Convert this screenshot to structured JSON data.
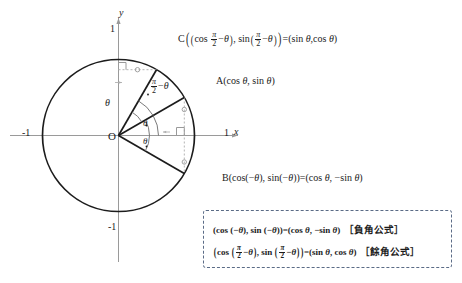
{
  "diagram": {
    "type": "unit-circle-trigonometry",
    "title_visible": false,
    "axes": {
      "x_axis_label": "x",
      "y_axis_label": "y",
      "origin_label": "O",
      "x_tick_neg_label": "-1",
      "x_tick_pos_label": "1",
      "y_tick_top_label": "1",
      "y_tick_bottom_label": "-1"
    },
    "points": {
      "A": {
        "name": "A",
        "label": "A(cos θ, sin θ)",
        "label_plain": "A(cos theta, sin theta)",
        "angle_deg": 30,
        "coords_unit": [
          0.866,
          0.5
        ]
      },
      "B": {
        "name": "B",
        "label": "B(cos(−θ), sin(−θ)) = (cos θ, −sin θ)",
        "label_plain": "B(cos(-theta), sin(-theta)) = (cos theta, -sin theta)",
        "angle_deg": -30,
        "coords_unit": [
          0.866,
          -0.5
        ]
      },
      "C": {
        "name": "C",
        "label": "C((cos(π/2 − θ), sin(π/2 − θ)) = (sin θ, cos θ)",
        "label_plain": "C((cos(pi/2 - theta), sin(pi/2 - theta)) = (sin theta, cos theta)",
        "angle_deg": 60,
        "coords_unit": [
          0.5,
          0.866
        ]
      }
    },
    "angles": {
      "theta_upper": "θ",
      "theta_first": "θ",
      "theta_second": "θ",
      "half_pi_minus_theta_numerator": "π",
      "half_pi_minus_theta_denominator": "2",
      "half_pi_minus_theta_suffix": "− θ"
    },
    "construction": {
      "dashed_lines": 2,
      "right_angle_markers": 2,
      "tick_marks": 4,
      "description": "horizontal dashed segment from y-axis to C; vertical dashed segment through A and B crossing the x-axis"
    }
  },
  "formula_box": {
    "border_style": "dashed",
    "border_color": "#5a6b86",
    "rows": [
      {
        "formula": "(cos (−θ), sin (−θ)) = (cos θ, −sin θ)",
        "tag": "［負角公式］",
        "tag_meaning": "negative-angle formula"
      },
      {
        "formula": "(cos(π/2 − θ), sin(π/2 − θ)) = (sin θ, cos θ)",
        "tag": "［餘角公式］",
        "tag_meaning": "complementary-angle formula"
      }
    ]
  },
  "colors": {
    "ink": "#1c1c1c",
    "axis": "#9a9a9a",
    "dashed_guide": "#b0b0b0",
    "box_border": "#5a6b86",
    "background": "#ffffff"
  }
}
